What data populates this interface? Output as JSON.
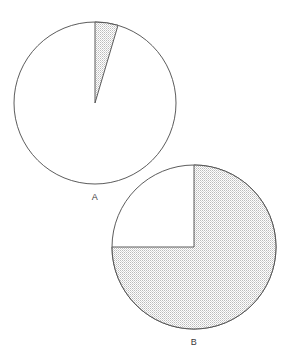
{
  "figure": {
    "background_color": "#ffffff",
    "outline_color": "#4a4a4a",
    "fill_pattern_color": "#b9b9b9",
    "label_color": "#3a3a3a"
  },
  "labels": {
    "pie_a": "A",
    "pie_b": "B"
  },
  "chart_data": [
    {
      "type": "pie",
      "name": "A",
      "title": "A",
      "center_x": 95,
      "center_y": 103,
      "radius": 81,
      "start_angle_deg": 0,
      "direction": "clockwise",
      "categories": [
        "shaded",
        "unshaded"
      ],
      "values": [
        4.6,
        95.4
      ],
      "slice_angles_deg": [
        16.5,
        343.5
      ],
      "fills": [
        "stipple",
        "none"
      ],
      "legend": "none",
      "grid": false
    },
    {
      "type": "pie",
      "name": "B",
      "title": "B",
      "center_x": 194,
      "center_y": 247,
      "radius": 82,
      "start_angle_deg": 0,
      "direction": "clockwise",
      "categories": [
        "shaded",
        "unshaded"
      ],
      "values": [
        75,
        25
      ],
      "slice_angles_deg": [
        270,
        90
      ],
      "fills": [
        "stipple",
        "none"
      ],
      "legend": "none",
      "grid": false
    }
  ]
}
